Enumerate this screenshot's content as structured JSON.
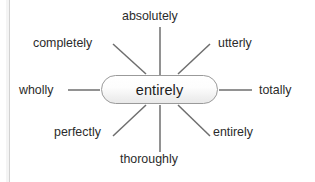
{
  "diagram": {
    "type": "radial-word-map",
    "center": {
      "label": "entirely",
      "shape": "rounded-rectangle",
      "fill": "#f3f3f3",
      "stroke": "#9a9a9a"
    },
    "line_color": "#6e6e6e",
    "text_color": "#2b2b2b",
    "background": "#ffffff",
    "spokes": [
      {
        "id": "absolutely",
        "label": "absolutely",
        "direction": "up",
        "label_x": 122,
        "label_y": 9,
        "x1": 160,
        "y1": 27,
        "x2": 160,
        "y2": 75
      },
      {
        "id": "completely",
        "label": "completely",
        "direction": "up-left",
        "label_x": 33,
        "label_y": 36,
        "x1": 113,
        "y1": 44,
        "x2": 146,
        "y2": 74
      },
      {
        "id": "utterly",
        "label": "utterly",
        "direction": "up-right",
        "label_x": 218,
        "label_y": 36,
        "x1": 210,
        "y1": 44,
        "x2": 178,
        "y2": 74
      },
      {
        "id": "wholly",
        "label": "wholly",
        "direction": "left",
        "label_x": 19,
        "label_y": 83,
        "x1": 68,
        "y1": 90,
        "x2": 100,
        "y2": 90
      },
      {
        "id": "totally",
        "label": "totally",
        "direction": "right",
        "label_x": 259,
        "label_y": 83,
        "x1": 219,
        "y1": 90,
        "x2": 252,
        "y2": 90
      },
      {
        "id": "perfectly",
        "label": "perfectly",
        "direction": "down-left",
        "label_x": 54,
        "label_y": 125,
        "x1": 113,
        "y1": 136,
        "x2": 146,
        "y2": 105
      },
      {
        "id": "entirely-2",
        "label": "entirely",
        "direction": "down-right",
        "label_x": 213,
        "label_y": 125,
        "x1": 210,
        "y1": 136,
        "x2": 178,
        "y2": 105
      },
      {
        "id": "thoroughly",
        "label": "thoroughly",
        "direction": "down",
        "label_x": 120,
        "label_y": 152,
        "x1": 160,
        "y1": 105,
        "x2": 160,
        "y2": 152
      }
    ]
  }
}
